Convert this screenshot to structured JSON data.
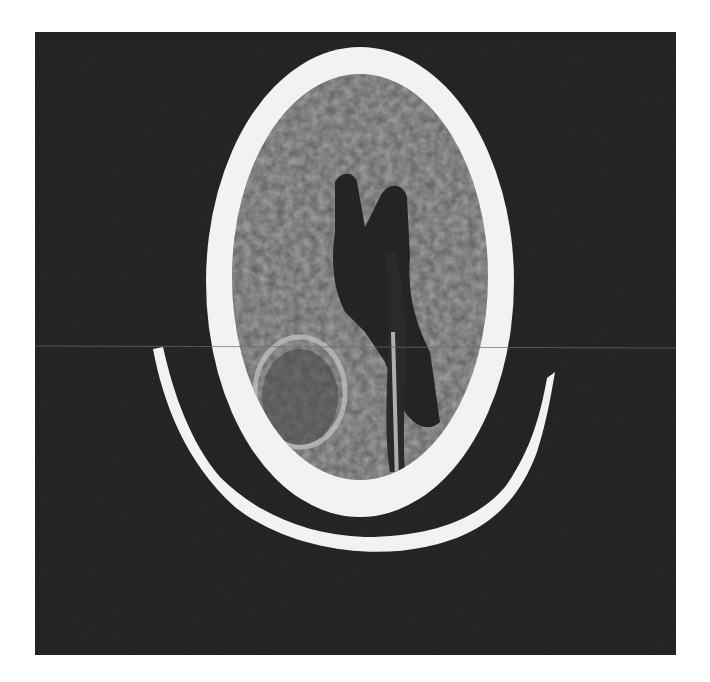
{
  "image": {
    "description": "Axial CT scan of the head, displayed as a grayscale film on a white background",
    "colors": {
      "page_background": "#ffffff",
      "panel_background": "#1c1c1c",
      "bone": "#f2f2f2",
      "brain_tissue": "#6e6e6e",
      "ventricles": "#222222"
    }
  }
}
